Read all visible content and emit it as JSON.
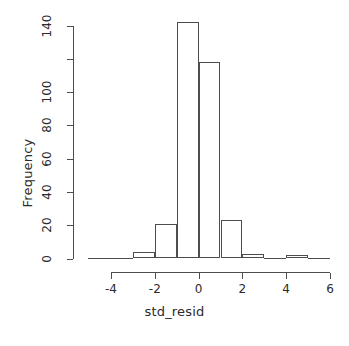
{
  "chart_data": {
    "type": "bar",
    "title": "",
    "xlabel": "std_resid",
    "ylabel": "Frequency",
    "bin_width": 1,
    "bin_edges": [
      -5,
      -4,
      -3,
      -2,
      -1,
      0,
      1,
      2,
      3,
      4,
      5,
      6
    ],
    "categories": [
      "-5 to -4",
      "-4 to -3",
      "-3 to -2",
      "-2 to -1",
      "-1 to 0",
      "0 to 1",
      "1 to 2",
      "2 to 3",
      "3 to 4",
      "4 to 5",
      "5 to 6"
    ],
    "values": [
      0,
      0,
      4,
      21,
      142,
      118,
      23,
      3,
      0,
      2,
      0
    ],
    "xlim": [
      -5,
      6
    ],
    "ylim": [
      0,
      142
    ],
    "xticks": [
      -4,
      -2,
      0,
      2,
      4,
      6
    ],
    "xtick_labels": [
      "-4",
      "-2",
      "0",
      "2",
      "4",
      "6"
    ],
    "yticks": [
      0,
      20,
      40,
      60,
      80,
      100,
      120,
      140
    ],
    "ytick_labels": [
      "0",
      "20",
      "40",
      "60",
      "80",
      "100",
      "120",
      "140"
    ],
    "ytick_labels_shown": [
      "0",
      "20",
      "40",
      "60",
      "80",
      "100",
      "",
      "140"
    ],
    "grid": false,
    "legend": null,
    "bar_fill": "#ffffff",
    "bar_stroke": "#4d4d4d",
    "axis_color": "#4d4d4d",
    "text_color": "#2b2b2b",
    "background": "#ffffff"
  }
}
